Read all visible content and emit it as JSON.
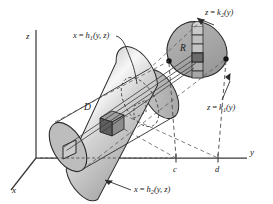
{
  "figure": {
    "background_color": "#ffffff",
    "ink_color": "#1a1a1a"
  },
  "axes": {
    "z_label": "z",
    "y_label": "y",
    "x_label": "x",
    "ticks": [
      {
        "label": "c",
        "axis": "y"
      },
      {
        "label": "d",
        "axis": "y"
      }
    ]
  },
  "regions": [
    {
      "name": "D",
      "label": "D",
      "description": "solid cylinder",
      "fill": "#bdbdbd"
    },
    {
      "name": "R",
      "label": "R",
      "description": "egg shaped plane region",
      "fill": "#a9a9a9"
    }
  ],
  "annotations": [
    {
      "id": "h1",
      "var": "x",
      "eq": "=",
      "fn": "h",
      "sub": "1",
      "args": "(y, z)",
      "text": "x = h1(y, z)"
    },
    {
      "id": "h2",
      "var": "x",
      "eq": "=",
      "fn": "h",
      "sub": "2",
      "args": "(y, z)",
      "text": "x = h2(y, z)"
    },
    {
      "id": "k1",
      "var": "z",
      "eq": "=",
      "fn": "k",
      "sub": "1",
      "args": "(y)",
      "text": "z = k1(y)"
    },
    {
      "id": "k2",
      "var": "z",
      "eq": "=",
      "fn": "k",
      "sub": "2",
      "args": "(y)",
      "text": "z = k2(y)"
    }
  ],
  "colors": {
    "cylinder_light": "#f2f2f2",
    "cylinder_mid": "#c4c4c4",
    "cylinder_dark": "#9e9e9e",
    "cap_fill": "#bababa",
    "region_fill": "#a8a8a8",
    "cube_dark": "#6d6d6d",
    "cube_face": "#909090",
    "stroke": "#2b2b2b",
    "dash": "#4a4a4a"
  }
}
